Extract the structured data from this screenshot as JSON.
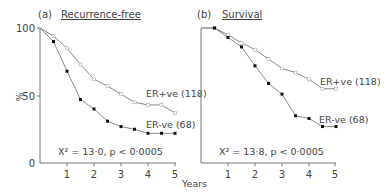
{
  "chart_data": [
    {
      "type": "line",
      "panel_label": "(a)",
      "title": "Recurrence-free",
      "xlabel": "Years",
      "ylabel": "%",
      "xlim": [
        0,
        5
      ],
      "ylim": [
        0,
        100
      ],
      "x_ticks": [
        "1",
        "2",
        "3",
        "4",
        "5"
      ],
      "y_ticks": [
        "0",
        "50",
        "100"
      ],
      "grid": false,
      "x": [
        0,
        0.5,
        1,
        1.5,
        2,
        2.5,
        3,
        3.5,
        4,
        4.5,
        5
      ],
      "series": [
        {
          "name": "ER+ve (118)",
          "marker": "open",
          "values": [
            100,
            94,
            85,
            73,
            62,
            57,
            51,
            45,
            43,
            43,
            37
          ]
        },
        {
          "name": "ER-ve (68)",
          "marker": "filled",
          "values": [
            100,
            90,
            68,
            47,
            40,
            31,
            27,
            25,
            22,
            22,
            22
          ]
        }
      ],
      "annotation": "X² = 13·0, p < 0·0005"
    },
    {
      "type": "line",
      "panel_label": "(b)",
      "title": "Survival",
      "xlabel": "Years",
      "ylabel": "%",
      "xlim": [
        0,
        5
      ],
      "ylim": [
        0,
        100
      ],
      "x_ticks": [
        "1",
        "2",
        "3",
        "4",
        "5"
      ],
      "y_ticks": [
        "0",
        "50",
        "100"
      ],
      "grid": false,
      "x": [
        0,
        0.5,
        1,
        1.5,
        2,
        2.5,
        3,
        3.5,
        4,
        4.5,
        5
      ],
      "series": [
        {
          "name": "ER+ve (118)",
          "marker": "open",
          "values": [
            100,
            100,
            95,
            89,
            84,
            77,
            70,
            67,
            62,
            55,
            55
          ]
        },
        {
          "name": "ER-ve (68)",
          "marker": "filled",
          "values": [
            100,
            100,
            93,
            86,
            72,
            59,
            51,
            35,
            33,
            27,
            27
          ]
        }
      ],
      "annotation": "X² = 13·8, p < 0·0005"
    }
  ],
  "labels": {
    "a_panel": "(a)",
    "a_title": "Recurrence-free",
    "a_pos": "ER+ve (118)",
    "a_neg": "ER-ve (68)",
    "a_stat": "X² = 13·0, p < 0·0005",
    "b_panel": "(b)",
    "b_title": "Survival",
    "b_pos": "ER+ve (118)",
    "b_neg": "ER-ve (68)",
    "b_stat": "X² = 13·8, p < 0·0005",
    "ylabel": "%",
    "xlabel": "Years",
    "y100": "100",
    "y50": "50",
    "y0": "0"
  },
  "colors": {
    "line": "#8a8a8a",
    "filled_marker": "#111111",
    "axis": "#777777"
  }
}
